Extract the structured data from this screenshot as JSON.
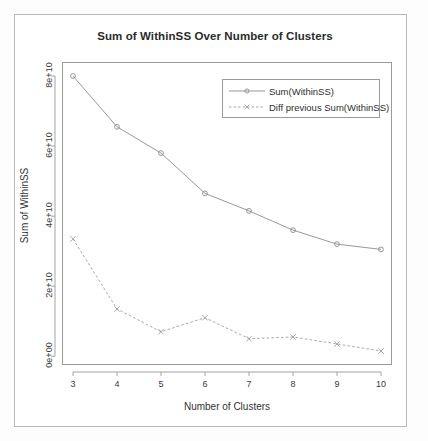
{
  "chart_data": {
    "type": "line",
    "title": "Sum of WithinSS Over Number of Clusters",
    "xlabel": "Number of Clusters",
    "ylabel": "Sum of WithinSS",
    "x": [
      3,
      4,
      5,
      6,
      7,
      8,
      9,
      10
    ],
    "xtick_labels": [
      "3",
      "4",
      "5",
      "6",
      "7",
      "8",
      "9",
      "10"
    ],
    "ytick_labels": [
      "0e+00",
      "2e+10",
      "4e+10",
      "6e+10",
      "8e+10"
    ],
    "ytick_values": [
      0,
      20000000000,
      40000000000,
      60000000000,
      80000000000
    ],
    "xlim": [
      2.75,
      10.25
    ],
    "ylim": [
      -2500000000,
      84000000000
    ],
    "grid": false,
    "legend_position": "top-right",
    "series": [
      {
        "name": "Sum(WithinSS)",
        "marker": "circle",
        "linestyle": "solid",
        "color": "#8d8d8d",
        "values": [
          80000000000,
          65500000000,
          58000000000,
          46500000000,
          41500000000,
          36000000000,
          32000000000,
          30500000000
        ]
      },
      {
        "name": "Diff previous Sum(WithinSS)",
        "marker": "x",
        "linestyle": "dashed",
        "color": "#9e9e9e",
        "values": [
          33500000000,
          13500000000,
          7000000000,
          11000000000,
          5000000000,
          5500000000,
          3500000000,
          1500000000
        ]
      }
    ]
  },
  "legend": {
    "items": [
      {
        "label": "Sum(WithinSS)"
      },
      {
        "label": "Diff previous Sum(WithinSS)"
      }
    ]
  },
  "colors": {
    "frame": "#b9b9b9",
    "axis": "#9a9a9a",
    "text": "#333333",
    "series_1": "#8d8d8d",
    "series_2": "#9e9e9e"
  }
}
